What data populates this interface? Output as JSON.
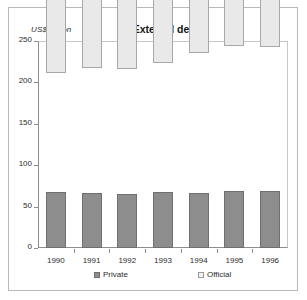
{
  "figure": {
    "unit_label": "US$  billion",
    "title": "External debt"
  },
  "legend": {
    "position": "bottom",
    "items": [
      {
        "label": "Private",
        "color": "#8d8d8d",
        "icon": "legend-swatch-private"
      },
      {
        "label": "Official",
        "color": "#f2f2f2",
        "icon": "legend-swatch-official"
      }
    ]
  },
  "chart_data": {
    "type": "bar",
    "stacked": true,
    "title": "External debt",
    "xlabel": "",
    "ylabel": "US$ billion",
    "ylim": [
      0,
      250
    ],
    "yticks": [
      0,
      50,
      100,
      150,
      200,
      250
    ],
    "ytick_labels": [
      "0",
      "50",
      "100",
      "150",
      "200",
      "250"
    ],
    "grid": false,
    "legend_position": "bottom",
    "categories": [
      "1990",
      "1991",
      "1992",
      "1993",
      "1994",
      "1995",
      "1996"
    ],
    "series": [
      {
        "name": "Private",
        "color": "#8d8d8d",
        "values": [
          68,
          67,
          65,
          68,
          67,
          69,
          69
        ]
      },
      {
        "name": "Official",
        "color": "#e9e9e9",
        "values": [
          143,
          150,
          151,
          155,
          168,
          175,
          174
        ]
      }
    ],
    "totals": [
      211,
      217,
      216,
      223,
      235,
      244,
      243
    ]
  }
}
